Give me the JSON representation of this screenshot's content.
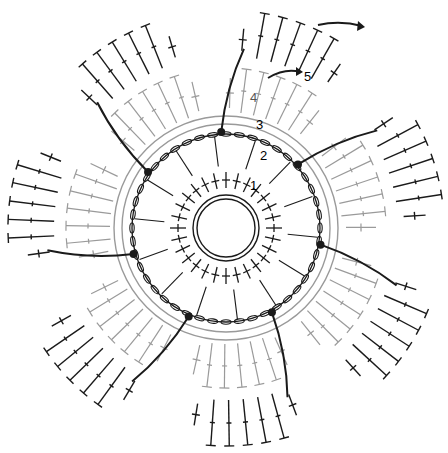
{
  "diagram": {
    "type": "crochet-chart",
    "center": [
      226,
      228
    ],
    "colors": {
      "primary": "#1a1a1a",
      "secondary": "#9a9a9a",
      "background": "#ffffff"
    },
    "round_labels": [
      {
        "text": "1",
        "x": 252,
        "y": 188
      },
      {
        "text": "2",
        "x": 262,
        "y": 158
      },
      {
        "text": "3",
        "x": 258,
        "y": 127
      },
      {
        "text": "4",
        "x": 252,
        "y": 100
      },
      {
        "text": "5",
        "x": 306,
        "y": 79
      }
    ],
    "rounds": [
      {
        "round": 1,
        "description": "double ring with single crochets",
        "stitch": "sc"
      },
      {
        "round": 2,
        "description": "sc with long stitches",
        "stitch": "sc"
      },
      {
        "round": 3,
        "description": "chain-space ring",
        "stitch": "ch"
      },
      {
        "round": 4,
        "description": "grey petals",
        "stitch": "dc"
      },
      {
        "round": 5,
        "description": "black outer petals",
        "stitch": "dc"
      }
    ],
    "petal_count": 7,
    "legend": []
  }
}
